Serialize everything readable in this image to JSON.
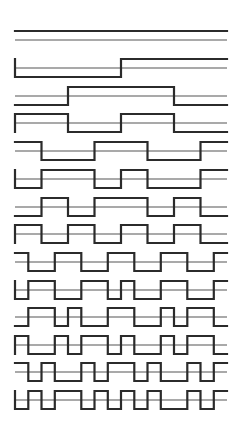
{
  "diagram": {
    "title": "",
    "colors": {
      "background": "#ffffff",
      "waveform": "#2b2b2b",
      "reference_line": "#555555"
    },
    "layout": {
      "x_start": 15,
      "x_end": 227,
      "segments": 16,
      "amplitude": 9,
      "row_reference_y": [
        40,
        68,
        96,
        123,
        151,
        179,
        207,
        234,
        262,
        290,
        317,
        345,
        372,
        400
      ]
    },
    "rows": [
      {
        "index": 0,
        "left_vertical": false,
        "levels": [
          1,
          1,
          1,
          1,
          1,
          1,
          1,
          1,
          1,
          1,
          1,
          1,
          1,
          1,
          1,
          1
        ]
      },
      {
        "index": 1,
        "left_vertical": true,
        "levels": [
          0,
          0,
          0,
          0,
          0,
          0,
          0,
          0,
          1,
          1,
          1,
          1,
          1,
          1,
          1,
          1
        ]
      },
      {
        "index": 2,
        "left_vertical": false,
        "levels": [
          0,
          0,
          0,
          0,
          1,
          1,
          1,
          1,
          1,
          1,
          1,
          1,
          0,
          0,
          0,
          0
        ]
      },
      {
        "index": 3,
        "left_vertical": true,
        "levels": [
          1,
          1,
          1,
          1,
          0,
          0,
          0,
          0,
          1,
          1,
          1,
          1,
          0,
          0,
          0,
          0
        ]
      },
      {
        "index": 4,
        "left_vertical": false,
        "levels": [
          1,
          1,
          0,
          0,
          0,
          0,
          1,
          1,
          1,
          1,
          0,
          0,
          0,
          0,
          1,
          1
        ]
      },
      {
        "index": 5,
        "left_vertical": true,
        "levels": [
          0,
          0,
          1,
          1,
          1,
          1,
          0,
          0,
          1,
          1,
          0,
          0,
          0,
          0,
          1,
          1
        ]
      },
      {
        "index": 6,
        "left_vertical": false,
        "levels": [
          0,
          0,
          1,
          1,
          0,
          0,
          1,
          1,
          1,
          1,
          0,
          0,
          1,
          1,
          0,
          0
        ]
      },
      {
        "index": 7,
        "left_vertical": true,
        "levels": [
          1,
          1,
          0,
          0,
          1,
          1,
          0,
          0,
          1,
          1,
          0,
          0,
          1,
          1,
          0,
          0
        ]
      },
      {
        "index": 8,
        "left_vertical": false,
        "levels": [
          1,
          0,
          0,
          1,
          1,
          0,
          0,
          1,
          1,
          0,
          0,
          1,
          1,
          0,
          0,
          1
        ]
      },
      {
        "index": 9,
        "left_vertical": true,
        "levels": [
          0,
          1,
          1,
          0,
          0,
          1,
          1,
          0,
          1,
          0,
          0,
          1,
          1,
          0,
          0,
          1
        ]
      },
      {
        "index": 10,
        "left_vertical": false,
        "levels": [
          0,
          1,
          1,
          0,
          1,
          0,
          0,
          1,
          1,
          0,
          0,
          1,
          0,
          1,
          1,
          0
        ]
      },
      {
        "index": 11,
        "left_vertical": true,
        "levels": [
          1,
          0,
          0,
          1,
          0,
          1,
          1,
          0,
          1,
          0,
          0,
          1,
          0,
          1,
          1,
          0
        ]
      },
      {
        "index": 12,
        "left_vertical": false,
        "levels": [
          1,
          0,
          1,
          0,
          0,
          1,
          0,
          1,
          1,
          0,
          1,
          0,
          0,
          1,
          0,
          1
        ]
      },
      {
        "index": 13,
        "left_vertical": true,
        "levels": [
          0,
          1,
          0,
          1,
          1,
          0,
          1,
          0,
          1,
          0,
          1,
          0,
          0,
          1,
          0,
          1
        ]
      }
    ]
  }
}
